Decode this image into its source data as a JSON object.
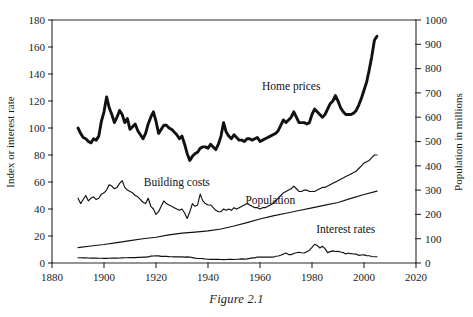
{
  "figure": {
    "caption": "Figure 2.1"
  },
  "chart_data": {
    "type": "line",
    "title": "",
    "xlabel": "",
    "ylabel": "Index or interest rate",
    "y2label": "Population in millions",
    "xlim": [
      1880,
      2020
    ],
    "ylim": [
      0,
      180
    ],
    "y2lim": [
      0,
      1000
    ],
    "xticks": [
      1880,
      1900,
      1920,
      1940,
      1960,
      1980,
      2000,
      2020
    ],
    "yticks": [
      0,
      20,
      40,
      60,
      80,
      100,
      120,
      140,
      160,
      180
    ],
    "y2ticks": [
      0,
      100,
      200,
      300,
      400,
      500,
      600,
      700,
      800,
      900,
      1000
    ],
    "grid": false,
    "legend_position": "inline-annotations",
    "annotations": [
      {
        "text": "Home prices",
        "x": 1972,
        "y": 128
      },
      {
        "text": "Building costs",
        "x": 1928,
        "y": 57
      },
      {
        "text": "Population",
        "x": 1964,
        "y": 44
      },
      {
        "text": "Interest rates",
        "x": 1993,
        "y": 22
      }
    ],
    "series": [
      {
        "name": "Home prices",
        "axis": "left",
        "line_weight": "thick",
        "x": [
          1890,
          1891,
          1892,
          1893,
          1894,
          1895,
          1896,
          1897,
          1898,
          1899,
          1900,
          1901,
          1902,
          1903,
          1904,
          1905,
          1906,
          1907,
          1908,
          1909,
          1910,
          1911,
          1912,
          1913,
          1914,
          1915,
          1916,
          1917,
          1918,
          1919,
          1920,
          1921,
          1922,
          1923,
          1924,
          1925,
          1926,
          1927,
          1928,
          1929,
          1930,
          1931,
          1932,
          1933,
          1934,
          1935,
          1936,
          1937,
          1938,
          1939,
          1940,
          1941,
          1942,
          1943,
          1944,
          1945,
          1946,
          1947,
          1948,
          1949,
          1950,
          1951,
          1952,
          1953,
          1954,
          1955,
          1956,
          1957,
          1958,
          1959,
          1960,
          1961,
          1962,
          1963,
          1964,
          1965,
          1966,
          1967,
          1968,
          1969,
          1970,
          1971,
          1972,
          1973,
          1974,
          1975,
          1976,
          1977,
          1978,
          1979,
          1980,
          1981,
          1982,
          1983,
          1984,
          1985,
          1986,
          1987,
          1988,
          1989,
          1990,
          1991,
          1992,
          1993,
          1994,
          1995,
          1996,
          1997,
          1998,
          1999,
          2000,
          2001,
          2002,
          2003,
          2004,
          2005
        ],
        "y": [
          100,
          96,
          93,
          92,
          90,
          89,
          92,
          91,
          94,
          105,
          112,
          123,
          115,
          110,
          104,
          108,
          113,
          110,
          104,
          107,
          99,
          101,
          103,
          98,
          95,
          92,
          96,
          103,
          108,
          112,
          105,
          96,
          99,
          102,
          102,
          100,
          99,
          97,
          95,
          92,
          94,
          88,
          81,
          76,
          79,
          81,
          82,
          85,
          86,
          86,
          85,
          88,
          86,
          84,
          88,
          94,
          104,
          97,
          94,
          92,
          95,
          93,
          91,
          91,
          90,
          92,
          92,
          91,
          92,
          93,
          90,
          91,
          92,
          93,
          94,
          95,
          96,
          98,
          102,
          106,
          104,
          106,
          108,
          112,
          108,
          104,
          104,
          104,
          103,
          104,
          110,
          114,
          112,
          110,
          108,
          110,
          114,
          118,
          120,
          124,
          120,
          115,
          112,
          110,
          110,
          110,
          111,
          113,
          117,
          122,
          128,
          134,
          143,
          153,
          165,
          168
        ]
      },
      {
        "name": "Building costs",
        "axis": "left",
        "line_weight": "thin",
        "x": [
          1890,
          1891,
          1892,
          1893,
          1894,
          1895,
          1896,
          1897,
          1898,
          1899,
          1900,
          1901,
          1902,
          1903,
          1904,
          1905,
          1906,
          1907,
          1908,
          1909,
          1910,
          1911,
          1912,
          1913,
          1914,
          1915,
          1916,
          1917,
          1918,
          1919,
          1920,
          1921,
          1922,
          1923,
          1924,
          1925,
          1926,
          1927,
          1928,
          1929,
          1930,
          1931,
          1932,
          1933,
          1934,
          1935,
          1936,
          1937,
          1938,
          1939,
          1940,
          1941,
          1942,
          1943,
          1944,
          1945,
          1946,
          1947,
          1948,
          1949,
          1950,
          1951,
          1952,
          1953,
          1954,
          1955,
          1956,
          1957,
          1958,
          1959,
          1960,
          1961,
          1962,
          1963,
          1964,
          1965,
          1966,
          1967,
          1968,
          1969,
          1970,
          1971,
          1972,
          1973,
          1974,
          1975,
          1976,
          1977,
          1978,
          1979,
          1980,
          1981,
          1982,
          1983,
          1984,
          1985,
          1986,
          1987,
          1988,
          1989,
          1990,
          1991,
          1992,
          1993,
          1994,
          1995,
          1996,
          1997,
          1998,
          1999,
          2000,
          2001,
          2002,
          2003,
          2004,
          2005
        ],
        "y": [
          48,
          44,
          47,
          50,
          46,
          48,
          49,
          47,
          48,
          51,
          52,
          54,
          58,
          57,
          55,
          56,
          59,
          61,
          56,
          54,
          53,
          52,
          50,
          49,
          47,
          45,
          44,
          48,
          42,
          40,
          36,
          38,
          42,
          46,
          44,
          43,
          42,
          41,
          40,
          39,
          40,
          37,
          33,
          38,
          44,
          42,
          43,
          51,
          46,
          44,
          43,
          43,
          41,
          39,
          38,
          38,
          40,
          39,
          40,
          39,
          41,
          40,
          41,
          42,
          43,
          44,
          43,
          42,
          41,
          41,
          40,
          41,
          41,
          42,
          43,
          44,
          46,
          48,
          50,
          52,
          53,
          54,
          55,
          57,
          55,
          53,
          53,
          54,
          54,
          53,
          53,
          53,
          54,
          55,
          56,
          56,
          57,
          58,
          59,
          60,
          61,
          62,
          63,
          64,
          65,
          66,
          67,
          68,
          70,
          72,
          74,
          75,
          76,
          78,
          80,
          80
        ]
      },
      {
        "name": "Population",
        "axis": "right",
        "unit": "millions",
        "line_weight": "thin",
        "x": [
          1890,
          1895,
          1900,
          1905,
          1910,
          1915,
          1920,
          1925,
          1930,
          1935,
          1940,
          1945,
          1950,
          1955,
          1960,
          1965,
          1970,
          1975,
          1980,
          1985,
          1990,
          1995,
          2000,
          2005
        ],
        "y": [
          63,
          70,
          76,
          84,
          92,
          100,
          106,
          116,
          123,
          127,
          132,
          140,
          152,
          166,
          181,
          194,
          205,
          216,
          227,
          238,
          249,
          266,
          282,
          296
        ]
      },
      {
        "name": "Interest rates",
        "axis": "left",
        "unit": "percent",
        "line_weight": "thin",
        "x": [
          1890,
          1891,
          1892,
          1893,
          1894,
          1895,
          1896,
          1897,
          1898,
          1899,
          1900,
          1901,
          1902,
          1903,
          1904,
          1905,
          1906,
          1907,
          1908,
          1909,
          1910,
          1911,
          1912,
          1913,
          1914,
          1915,
          1916,
          1917,
          1918,
          1919,
          1920,
          1921,
          1922,
          1923,
          1924,
          1925,
          1926,
          1927,
          1928,
          1929,
          1930,
          1931,
          1932,
          1933,
          1934,
          1935,
          1936,
          1937,
          1938,
          1939,
          1940,
          1941,
          1942,
          1943,
          1944,
          1945,
          1946,
          1947,
          1948,
          1949,
          1950,
          1951,
          1952,
          1953,
          1954,
          1955,
          1956,
          1957,
          1958,
          1959,
          1960,
          1961,
          1962,
          1963,
          1964,
          1965,
          1966,
          1967,
          1968,
          1969,
          1970,
          1971,
          1972,
          1973,
          1974,
          1975,
          1976,
          1977,
          1978,
          1979,
          1980,
          1981,
          1982,
          1983,
          1984,
          1985,
          1986,
          1987,
          1988,
          1989,
          1990,
          1991,
          1992,
          1993,
          1994,
          1995,
          1996,
          1997,
          1998,
          1999,
          2000,
          2001,
          2002,
          2003,
          2004,
          2005
        ],
        "y": [
          3.9,
          3.9,
          3.8,
          3.8,
          3.7,
          3.6,
          3.6,
          3.6,
          3.5,
          3.5,
          3.4,
          3.4,
          3.5,
          3.6,
          3.6,
          3.6,
          3.7,
          3.8,
          3.9,
          3.9,
          4.0,
          4.0,
          4.0,
          4.2,
          4.2,
          4.3,
          4.3,
          4.5,
          5.1,
          5.2,
          5.4,
          5.3,
          4.9,
          4.9,
          4.9,
          4.7,
          4.6,
          4.5,
          4.5,
          4.6,
          4.5,
          4.3,
          4.5,
          4.4,
          4.0,
          3.6,
          3.4,
          3.3,
          3.2,
          3.0,
          2.8,
          2.7,
          2.8,
          2.7,
          2.7,
          2.6,
          2.5,
          2.6,
          2.8,
          2.7,
          2.6,
          2.8,
          2.9,
          3.1,
          2.9,
          3.1,
          3.4,
          3.8,
          3.8,
          4.4,
          4.4,
          4.3,
          4.3,
          4.3,
          4.3,
          4.3,
          5.0,
          5.2,
          5.7,
          6.7,
          7.4,
          6.2,
          6.2,
          7.0,
          7.6,
          8.0,
          7.6,
          7.4,
          8.4,
          9.4,
          11.5,
          13.9,
          13.0,
          11.1,
          12.4,
          10.6,
          7.7,
          8.4,
          9.0,
          8.5,
          8.6,
          8.1,
          7.7,
          6.6,
          7.4,
          6.9,
          6.7,
          6.6,
          5.6,
          5.9,
          6.0,
          5.5,
          5.4,
          4.8,
          4.6,
          4.6
        ]
      }
    ]
  }
}
